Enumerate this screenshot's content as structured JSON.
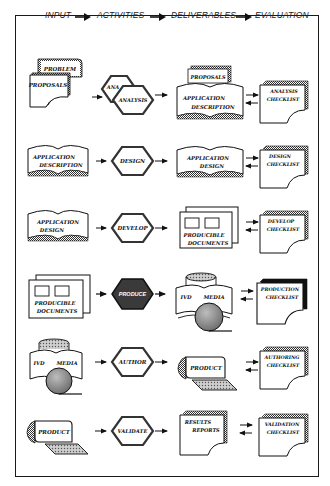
{
  "header": {
    "stages": [
      "INPUT",
      "ACTIVITIES",
      "DELIVERABLES",
      "EVALUATION"
    ]
  },
  "colors": {
    "line": "#1a1a1a",
    "hatch": "#555555",
    "dark_fill": "#3a3a3a",
    "disc_fill": "#8a8a8a",
    "background": "#ffffff"
  },
  "rows": [
    {
      "input": {
        "shape": "stacked-documents",
        "labels": [
          "PROBLEM",
          "PROPOSALS"
        ]
      },
      "activity": {
        "shape": "double-hexagon",
        "labels": [
          "ANA",
          "ANALYSIS"
        ]
      },
      "deliverable": {
        "shape": "book-with-document",
        "labels": [
          "PROPOSALS",
          "APPLICATION",
          "DESCRIPTION"
        ]
      },
      "evaluation": {
        "shape": "checklist-page",
        "labels": [
          "ANALYSIS",
          "CHECKLIST"
        ]
      }
    },
    {
      "input": {
        "shape": "open-book",
        "labels": [
          "APPLICATION",
          "DESCRIPTION"
        ]
      },
      "activity": {
        "shape": "hexagon",
        "labels": [
          "DESIGN"
        ]
      },
      "deliverable": {
        "shape": "open-book",
        "labels": [
          "APPLICATION",
          "DESIGN"
        ]
      },
      "evaluation": {
        "shape": "checklist-page",
        "labels": [
          "DESIGN",
          "CHECKLIST"
        ]
      }
    },
    {
      "input": {
        "shape": "open-book",
        "labels": [
          "APPLICATION",
          "DESIGN"
        ]
      },
      "activity": {
        "shape": "hexagon",
        "labels": [
          "DEVELOP"
        ]
      },
      "deliverable": {
        "shape": "stacked-frames",
        "labels": [
          "PRODUCIBLE",
          "DOCUMENTS"
        ]
      },
      "evaluation": {
        "shape": "checklist-page",
        "labels": [
          "DEVELOP",
          "CHECKLIST"
        ]
      }
    },
    {
      "input": {
        "shape": "stacked-frames",
        "labels": [
          "PRODUCIBLE",
          "DOCUMENTS"
        ]
      },
      "activity": {
        "shape": "dark-hexagon",
        "labels": [
          "PRODUCE"
        ]
      },
      "deliverable": {
        "shape": "media-book",
        "labels": [
          "IVD",
          "MEDIA"
        ]
      },
      "evaluation": {
        "shape": "checklist-page",
        "labels": [
          "PRODUCTION",
          "CHECKLIST"
        ]
      }
    },
    {
      "input": {
        "shape": "media-book",
        "labels": [
          "IVD",
          "MEDIA"
        ]
      },
      "activity": {
        "shape": "hexagon",
        "labels": [
          "AUTHOR"
        ]
      },
      "deliverable": {
        "shape": "product-terminal",
        "labels": [
          "PRODUCT"
        ]
      },
      "evaluation": {
        "shape": "checklist-page",
        "labels": [
          "AUTHORING",
          "CHECKLIST"
        ]
      }
    },
    {
      "input": {
        "shape": "product-terminal",
        "labels": [
          "PRODUCT"
        ]
      },
      "activity": {
        "shape": "hexagon",
        "labels": [
          "VALIDATE"
        ]
      },
      "deliverable": {
        "shape": "report-page",
        "labels": [
          "RESULTS",
          "REPORTS"
        ]
      },
      "evaluation": {
        "shape": "checklist-page",
        "labels": [
          "VALIDATION",
          "CHECKLIST"
        ]
      }
    }
  ]
}
